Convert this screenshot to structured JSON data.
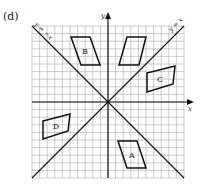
{
  "figure_label": "(d)",
  "grid": {
    "origin_px": [
      108,
      102
    ],
    "cell_px": 7.6,
    "range": [
      -10,
      10
    ],
    "line_color": "#aaaaaa",
    "axis_color": "#111111"
  },
  "axes": {
    "x_label": "x",
    "y_label": "y"
  },
  "lines": [
    {
      "label": "y = x",
      "color": "#111111"
    },
    {
      "label": "y = −x",
      "color": "#111111"
    }
  ],
  "shapes": [
    {
      "label": "B",
      "points_px": [
        [
          71,
          37
        ],
        [
          90,
          37
        ],
        [
          100,
          65
        ],
        [
          81,
          65
        ]
      ],
      "label_px": [
        85,
        54
      ]
    },
    {
      "label": "",
      "points_px": [
        [
          127,
          37
        ],
        [
          146,
          37
        ],
        [
          139,
          65
        ],
        [
          119,
          65
        ]
      ],
      "label_px": [
        133,
        54
      ]
    },
    {
      "label": "C",
      "points_px": [
        [
          147,
          73
        ],
        [
          175,
          66
        ],
        [
          173,
          84
        ],
        [
          147,
          92
        ]
      ],
      "label_px": [
        160,
        82
      ]
    },
    {
      "label": "D",
      "points_px": [
        [
          43,
          121
        ],
        [
          70,
          114
        ],
        [
          68,
          131
        ],
        [
          43,
          139
        ]
      ],
      "label_px": [
        56,
        129
      ]
    },
    {
      "label": "A",
      "points_px": [
        [
          118,
          141
        ],
        [
          137,
          141
        ],
        [
          146,
          168
        ],
        [
          127,
          168
        ]
      ],
      "label_px": [
        132,
        158
      ]
    }
  ]
}
